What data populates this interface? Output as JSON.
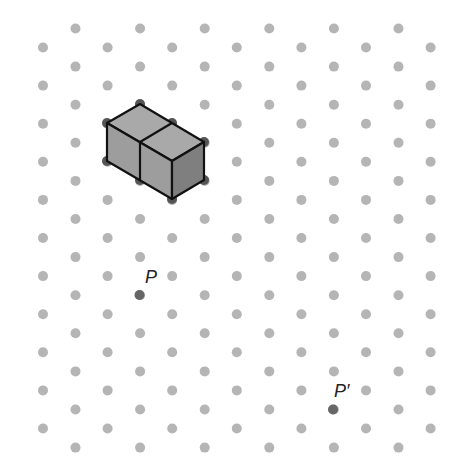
{
  "diagram": {
    "type": "isometric-dot-grid",
    "background": "#ffffff",
    "grid": {
      "dot_color": "#b5b5b5",
      "dot_radius": 5,
      "col_spacing": 64.6,
      "row_spacing": 38.1,
      "even_rows": {
        "start_y": 28.5,
        "count": 12,
        "start_x": 75.5,
        "cols": 6
      },
      "odd_rows": {
        "start_y": 47.5,
        "count": 11,
        "start_x": 43,
        "cols": 7
      }
    },
    "solid": {
      "name": "two-cube-prism",
      "stroke": "#111111",
      "vertex_color": "#555555",
      "faces": [
        {
          "name": "top-face",
          "fill": "#a9a9a9",
          "points": [
            [
              140,
              104
            ],
            [
              204,
              142
            ],
            [
              172,
              161
            ],
            [
              107,
              123
            ]
          ]
        },
        {
          "name": "front-face",
          "fill": "#9d9d9d",
          "points": [
            [
              107,
              123
            ],
            [
              172,
              161
            ],
            [
              172,
              199
            ],
            [
              107,
              161
            ]
          ]
        },
        {
          "name": "right-face",
          "fill": "#7f7f7f",
          "points": [
            [
              172,
              161
            ],
            [
              204,
              142
            ],
            [
              204,
              180
            ],
            [
              172,
              199
            ]
          ]
        }
      ],
      "inner_edges": [
        [
          [
            172,
            123
          ],
          [
            140,
            142
          ]
        ],
        [
          [
            140,
            142
          ],
          [
            140,
            180
          ]
        ]
      ],
      "vertices": [
        [
          140,
          104
        ],
        [
          107,
          123
        ],
        [
          172,
          123
        ],
        [
          204,
          142
        ],
        [
          107,
          161
        ],
        [
          204,
          180
        ],
        [
          172,
          199
        ],
        [
          140,
          180
        ]
      ]
    },
    "points": [
      {
        "label": "P",
        "x": 139.5,
        "y": 295,
        "color": "#666666",
        "label_x": 145,
        "label_y": 268
      },
      {
        "label": "P′",
        "x": 333,
        "y": 409.5,
        "color": "#666666",
        "label_x": 334,
        "label_y": 382
      }
    ]
  }
}
